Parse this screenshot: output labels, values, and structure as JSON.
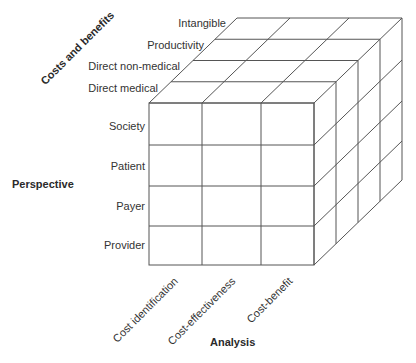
{
  "diagram": {
    "type": "3d-cube-matrix",
    "line_color": "#555555",
    "axes": {
      "costs_and_benefits": {
        "title": "Costs and benefits",
        "labels": [
          "Intangible",
          "Productivity",
          "Direct non-medical",
          "Direct medical"
        ]
      },
      "perspective": {
        "title": "Perspective",
        "labels": [
          "Society",
          "Patient",
          "Payer",
          "Provider"
        ]
      },
      "analysis": {
        "title": "Analysis",
        "labels": [
          "Cost identification",
          "Cost-effectiveness",
          "Cost-benefit"
        ]
      }
    }
  }
}
